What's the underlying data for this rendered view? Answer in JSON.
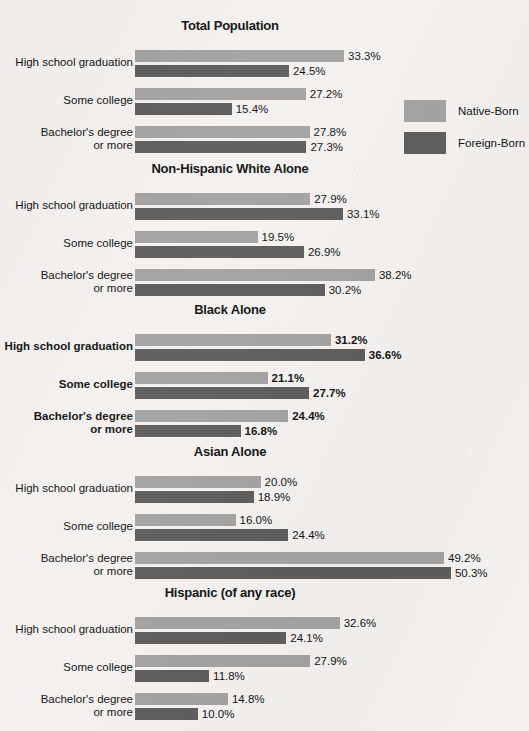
{
  "legend": {
    "items": [
      {
        "label": "Native-Born",
        "key": "native",
        "color": "#a2a2a2"
      },
      {
        "label": "Foreign-Born",
        "key": "foreign",
        "color": "#5c5c5c"
      }
    ]
  },
  "axis": {
    "px_per_percent": 6.28,
    "bar_origin_x": 135
  },
  "chart_data": {
    "type": "bar",
    "orientation": "horizontal",
    "title": "",
    "xlabel": "",
    "ylabel": "",
    "grid": false,
    "legend_position": "right",
    "legend": [
      "Native-Born",
      "Foreign-Born"
    ],
    "categories": [
      "High school graduation",
      "Some college",
      "Bachelor's degree or more"
    ],
    "panels": [
      {
        "title": "Total Population",
        "emphasis": false,
        "groups": [
          {
            "label_line1": "High school graduation",
            "label_line2": "",
            "native": 33.3,
            "foreign": 24.5,
            "native_label": "33.3%",
            "foreign_label": "24.5%"
          },
          {
            "label_line1": "Some college",
            "label_line2": "",
            "native": 27.2,
            "foreign": 15.4,
            "native_label": "27.2%",
            "foreign_label": "15.4%"
          },
          {
            "label_line1": "Bachelor's degree",
            "label_line2": "or more",
            "native": 27.8,
            "foreign": 27.3,
            "native_label": "27.8%",
            "foreign_label": "27.3%"
          }
        ]
      },
      {
        "title": "Non-Hispanic White Alone",
        "emphasis": false,
        "groups": [
          {
            "label_line1": "High school graduation",
            "label_line2": "",
            "native": 27.9,
            "foreign": 33.1,
            "native_label": "27.9%",
            "foreign_label": "33.1%"
          },
          {
            "label_line1": "Some college",
            "label_line2": "",
            "native": 19.5,
            "foreign": 26.9,
            "native_label": "19.5%",
            "foreign_label": "26.9%"
          },
          {
            "label_line1": "Bachelor's degree",
            "label_line2": "or more",
            "native": 38.2,
            "foreign": 30.2,
            "native_label": "38.2%",
            "foreign_label": "30.2%"
          }
        ]
      },
      {
        "title": "Black Alone",
        "emphasis": true,
        "groups": [
          {
            "label_line1": "High school graduation",
            "label_line2": "",
            "native": 31.2,
            "foreign": 36.6,
            "native_label": "31.2%",
            "foreign_label": "36.6%"
          },
          {
            "label_line1": "Some college",
            "label_line2": "",
            "native": 21.1,
            "foreign": 27.7,
            "native_label": "21.1%",
            "foreign_label": "27.7%"
          },
          {
            "label_line1": "Bachelor's degree",
            "label_line2": "or more",
            "native": 24.4,
            "foreign": 16.8,
            "native_label": "24.4%",
            "foreign_label": "16.8%"
          }
        ]
      },
      {
        "title": "Asian Alone",
        "emphasis": false,
        "groups": [
          {
            "label_line1": "High school graduation",
            "label_line2": "",
            "native": 20.0,
            "foreign": 18.9,
            "native_label": "20.0%",
            "foreign_label": "18.9%"
          },
          {
            "label_line1": "Some college",
            "label_line2": "",
            "native": 16.0,
            "foreign": 24.4,
            "native_label": "16.0%",
            "foreign_label": "24.4%"
          },
          {
            "label_line1": "Bachelor's degree",
            "label_line2": "or more",
            "native": 49.2,
            "foreign": 50.3,
            "native_label": "49.2%",
            "foreign_label": "50.3%"
          }
        ]
      },
      {
        "title": "Hispanic (of any race)",
        "emphasis": false,
        "groups": [
          {
            "label_line1": "High school graduation",
            "label_line2": "",
            "native": 32.6,
            "foreign": 24.1,
            "native_label": "32.6%",
            "foreign_label": "24.1%"
          },
          {
            "label_line1": "Some college",
            "label_line2": "",
            "native": 27.9,
            "foreign": 11.8,
            "native_label": "27.9%",
            "foreign_label": "11.8%"
          },
          {
            "label_line1": "Bachelor's degree",
            "label_line2": "or more",
            "native": 14.8,
            "foreign": 10.0,
            "native_label": "14.8%",
            "foreign_label": "10.0%"
          }
        ]
      }
    ]
  }
}
